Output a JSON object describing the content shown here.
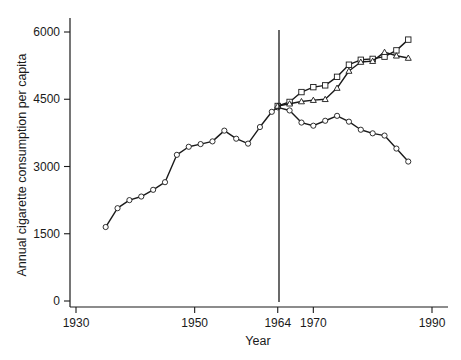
{
  "chart_data": {
    "type": "line",
    "title": "",
    "xlabel": "Year",
    "ylabel": "Annual cigarette consumption per capita",
    "xlim": [
      1930,
      1990
    ],
    "ylim": [
      0,
      6000
    ],
    "x_ticks": [
      1930,
      1950,
      1964,
      1970,
      1990
    ],
    "y_ticks": [
      0,
      1500,
      3000,
      4500,
      6000
    ],
    "grid": false,
    "legend": null,
    "annotations": [
      {
        "type": "vertical_line",
        "x": 1964,
        "label": "1964"
      }
    ],
    "series": [
      {
        "name": "Actual consumption",
        "marker": "circle",
        "x": [
          1935,
          1937,
          1939,
          1941,
          1943,
          1945,
          1947,
          1949,
          1951,
          1953,
          1955,
          1957,
          1959,
          1961,
          1963,
          1964,
          1966,
          1968,
          1970,
          1972,
          1974,
          1976,
          1978,
          1980,
          1982,
          1984,
          1986
        ],
        "y": [
          1650,
          2070,
          2250,
          2330,
          2480,
          2650,
          3260,
          3440,
          3500,
          3560,
          3800,
          3620,
          3510,
          3880,
          4220,
          4320,
          4250,
          3980,
          3910,
          4020,
          4130,
          4000,
          3820,
          3740,
          3690,
          3400,
          3110
        ]
      },
      {
        "name": "Projection (squares)",
        "marker": "square",
        "x": [
          1964,
          1966,
          1968,
          1970,
          1972,
          1974,
          1976,
          1978,
          1980,
          1982,
          1984,
          1986
        ],
        "y": [
          4350,
          4440,
          4660,
          4770,
          4810,
          5000,
          5270,
          5380,
          5400,
          5450,
          5590,
          5830
        ]
      },
      {
        "name": "Projection (triangles)",
        "marker": "triangle",
        "x": [
          1964,
          1966,
          1968,
          1970,
          1972,
          1974,
          1976,
          1978,
          1980,
          1982,
          1984,
          1986
        ],
        "y": [
          4350,
          4400,
          4450,
          4480,
          4500,
          4750,
          5130,
          5330,
          5350,
          5550,
          5470,
          5420
        ]
      }
    ]
  },
  "labels": {
    "x_axis_title": "Year",
    "y_axis_title": "Annual cigarette consumption per capita",
    "x_tick_labels": [
      "1930",
      "1950",
      "1964",
      "1970",
      "1990"
    ],
    "y_tick_labels": [
      "0",
      "1500",
      "3000",
      "4500",
      "6000"
    ]
  },
  "colors": {
    "line": "#1a1a1a",
    "marker_fill": "#ffffff",
    "background": "#ffffff"
  }
}
